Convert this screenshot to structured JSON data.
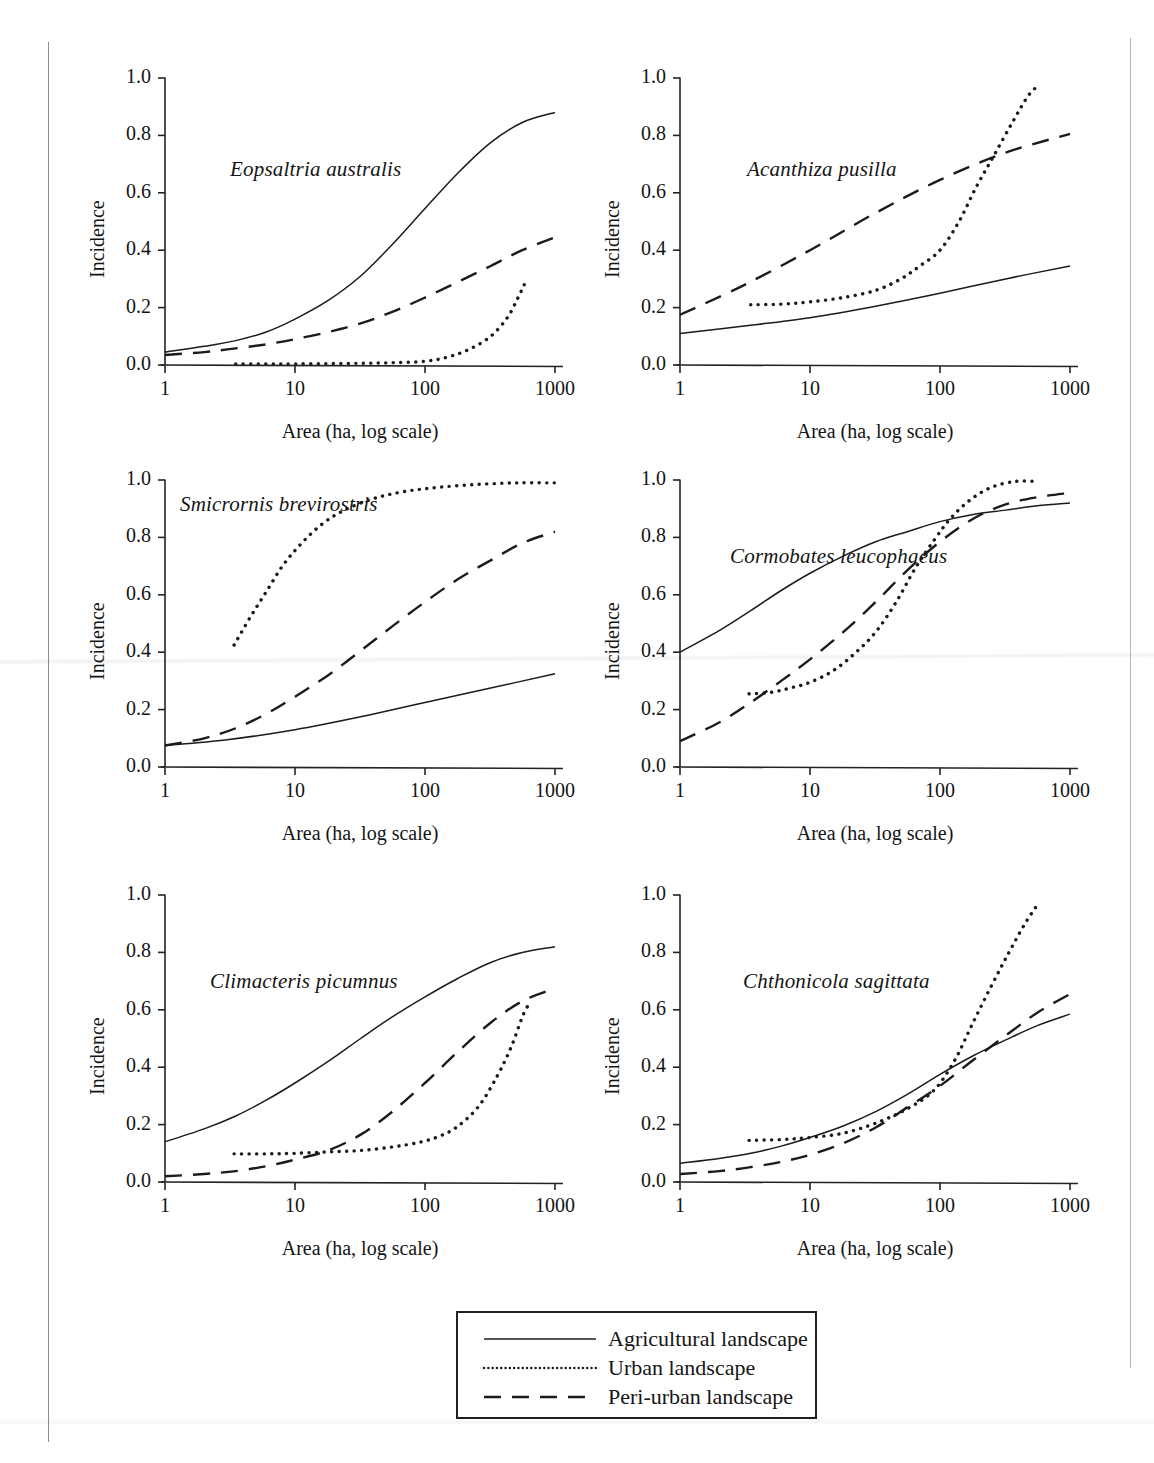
{
  "figure": {
    "axis_labels": {
      "x": "Area (ha, log scale)",
      "y": "Incidence"
    },
    "x_ticks": [
      "1",
      "10",
      "100",
      "1000"
    ],
    "y_ticks": [
      "0.0",
      "0.2",
      "0.4",
      "0.6",
      "0.8",
      "1.0"
    ]
  },
  "legend": {
    "items": [
      {
        "label": "Agricultural landscape",
        "style": "solid",
        "swatch": "solid-line-swatch"
      },
      {
        "label": "Urban landscape",
        "style": "dotted",
        "swatch": "dotted-line-swatch"
      },
      {
        "label": "Peri-urban landscape",
        "style": "dashed",
        "swatch": "dashed-line-swatch"
      }
    ]
  },
  "panels": [
    {
      "id": "eopsaltria-australis",
      "species": "Eopsaltria australis"
    },
    {
      "id": "acanthiza-pusilla",
      "species": "Acanthiza pusilla"
    },
    {
      "id": "smicrornis-brevirostris",
      "species": "Smicrornis brevirostris"
    },
    {
      "id": "cormobates-leucophaeus",
      "species": "Cormobates leucophaeus"
    },
    {
      "id": "climacteris-picumnus",
      "species": "Climacteris picumnus"
    },
    {
      "id": "chthonicola-sagittata",
      "species": "Chthonicola sagittata"
    }
  ],
  "chart_data": [
    {
      "type": "line",
      "title": "Eopsaltria australis",
      "xlabel": "Area (ha, log scale)",
      "ylabel": "Incidence",
      "xscale": "log",
      "xlim": [
        1,
        1000
      ],
      "ylim": [
        0,
        1
      ],
      "xticks": [
        1,
        10,
        100,
        1000
      ],
      "yticks": [
        0.0,
        0.2,
        0.4,
        0.6,
        0.8,
        1.0
      ],
      "grid": false,
      "series": [
        {
          "name": "Agricultural landscape",
          "style": "solid",
          "x": [
            1,
            2,
            3.5,
            6,
            10,
            18,
            32,
            56,
            100,
            180,
            320,
            560,
            1000
          ],
          "y": [
            0.045,
            0.065,
            0.085,
            0.115,
            0.16,
            0.225,
            0.31,
            0.42,
            0.545,
            0.67,
            0.775,
            0.845,
            0.88
          ]
        },
        {
          "name": "Urban landscape",
          "style": "dotted",
          "x": [
            3.5,
            6,
            10,
            18,
            32,
            56,
            100,
            150,
            220,
            320,
            430,
            520,
            580
          ],
          "y": [
            0.004,
            0.004,
            0.004,
            0.005,
            0.006,
            0.008,
            0.013,
            0.028,
            0.055,
            0.1,
            0.165,
            0.235,
            0.28
          ]
        },
        {
          "name": "Peri-urban landscape",
          "style": "dashed",
          "x": [
            1,
            2,
            3.5,
            6,
            10,
            18,
            32,
            56,
            100,
            180,
            320,
            560,
            1000
          ],
          "y": [
            0.035,
            0.045,
            0.058,
            0.072,
            0.09,
            0.115,
            0.145,
            0.185,
            0.235,
            0.29,
            0.345,
            0.4,
            0.445
          ]
        }
      ]
    },
    {
      "type": "line",
      "title": "Acanthiza pusilla",
      "xlabel": "Area (ha, log scale)",
      "ylabel": "Incidence",
      "xscale": "log",
      "xlim": [
        1,
        1000
      ],
      "ylim": [
        0,
        1
      ],
      "xticks": [
        1,
        10,
        100,
        1000
      ],
      "yticks": [
        0.0,
        0.2,
        0.4,
        0.6,
        0.8,
        1.0
      ],
      "grid": false,
      "series": [
        {
          "name": "Agricultural landscape",
          "style": "solid",
          "x": [
            1,
            3,
            10,
            32,
            100,
            320,
            1000
          ],
          "y": [
            0.11,
            0.135,
            0.165,
            0.205,
            0.25,
            0.3,
            0.345
          ]
        },
        {
          "name": "Urban landscape",
          "style": "dotted",
          "x": [
            3.5,
            6,
            10,
            18,
            32,
            50,
            70,
            100,
            140,
            190,
            260,
            360,
            480,
            580
          ],
          "y": [
            0.21,
            0.212,
            0.22,
            0.235,
            0.26,
            0.3,
            0.345,
            0.4,
            0.5,
            0.62,
            0.73,
            0.845,
            0.94,
            0.975
          ]
        },
        {
          "name": "Peri-urban landscape",
          "style": "dashed",
          "x": [
            1,
            3,
            10,
            32,
            100,
            320,
            1000
          ],
          "y": [
            0.175,
            0.275,
            0.4,
            0.53,
            0.645,
            0.74,
            0.805
          ]
        }
      ]
    },
    {
      "type": "line",
      "title": "Smicrornis brevirostris",
      "xlabel": "Area (ha, log scale)",
      "ylabel": "Incidence",
      "xscale": "log",
      "xlim": [
        1,
        1000
      ],
      "ylim": [
        0,
        1
      ],
      "xticks": [
        1,
        10,
        100,
        1000
      ],
      "yticks": [
        0.0,
        0.2,
        0.4,
        0.6,
        0.8,
        1.0
      ],
      "grid": false,
      "series": [
        {
          "name": "Agricultural landscape",
          "style": "solid",
          "x": [
            1,
            3,
            10,
            32,
            100,
            320,
            1000
          ],
          "y": [
            0.075,
            0.095,
            0.13,
            0.175,
            0.225,
            0.275,
            0.325
          ]
        },
        {
          "name": "Urban landscape",
          "style": "dotted",
          "x": [
            3.4,
            4.5,
            6,
            8,
            11,
            16,
            24,
            40,
            70,
            130,
            260,
            520,
            1000
          ],
          "y": [
            0.425,
            0.52,
            0.61,
            0.7,
            0.775,
            0.845,
            0.895,
            0.935,
            0.96,
            0.975,
            0.985,
            0.99,
            0.99
          ]
        },
        {
          "name": "Peri-urban landscape",
          "style": "dashed",
          "x": [
            1,
            2,
            3.5,
            6,
            10,
            18,
            32,
            56,
            100,
            180,
            320,
            560,
            1000
          ],
          "y": [
            0.075,
            0.1,
            0.135,
            0.185,
            0.245,
            0.32,
            0.405,
            0.49,
            0.575,
            0.655,
            0.72,
            0.78,
            0.82
          ]
        }
      ]
    },
    {
      "type": "line",
      "title": "Cormobates leucophaeus",
      "xlabel": "Area (ha, log scale)",
      "ylabel": "Incidence",
      "xscale": "log",
      "xlim": [
        1,
        1000
      ],
      "ylim": [
        0,
        1
      ],
      "xticks": [
        1,
        10,
        100,
        1000
      ],
      "yticks": [
        0.0,
        0.2,
        0.4,
        0.6,
        0.8,
        1.0
      ],
      "grid": false,
      "series": [
        {
          "name": "Agricultural landscape",
          "style": "solid",
          "x": [
            1,
            2,
            3.5,
            6,
            10,
            18,
            32,
            56,
            100,
            180,
            320,
            560,
            1000
          ],
          "y": [
            0.4,
            0.475,
            0.545,
            0.615,
            0.675,
            0.735,
            0.785,
            0.82,
            0.855,
            0.88,
            0.895,
            0.91,
            0.92
          ]
        },
        {
          "name": "Urban landscape",
          "style": "dotted",
          "x": [
            3.4,
            5,
            7,
            10,
            15,
            22,
            32,
            46,
            65,
            90,
            120,
            170,
            250,
            380,
            560
          ],
          "y": [
            0.255,
            0.26,
            0.275,
            0.295,
            0.335,
            0.395,
            0.47,
            0.575,
            0.695,
            0.79,
            0.865,
            0.93,
            0.975,
            0.995,
            0.995
          ]
        },
        {
          "name": "Peri-urban landscape",
          "style": "dashed",
          "x": [
            1,
            2,
            3.5,
            6,
            10,
            18,
            32,
            56,
            100,
            180,
            320,
            560,
            1000
          ],
          "y": [
            0.09,
            0.155,
            0.225,
            0.3,
            0.375,
            0.47,
            0.575,
            0.685,
            0.785,
            0.865,
            0.915,
            0.94,
            0.955
          ]
        }
      ]
    },
    {
      "type": "line",
      "title": "Climacteris picumnus",
      "xlabel": "Area (ha, log scale)",
      "ylabel": "Incidence",
      "xscale": "log",
      "xlim": [
        1,
        1000
      ],
      "ylim": [
        0,
        1
      ],
      "xticks": [
        1,
        10,
        100,
        1000
      ],
      "yticks": [
        0.0,
        0.2,
        0.4,
        0.6,
        0.8,
        1.0
      ],
      "grid": false,
      "series": [
        {
          "name": "Agricultural landscape",
          "style": "solid",
          "x": [
            1,
            2,
            3.5,
            6,
            10,
            18,
            32,
            56,
            100,
            180,
            320,
            560,
            1000
          ],
          "y": [
            0.14,
            0.185,
            0.23,
            0.285,
            0.345,
            0.42,
            0.5,
            0.575,
            0.645,
            0.71,
            0.765,
            0.8,
            0.82
          ]
        },
        {
          "name": "Urban landscape",
          "style": "dotted",
          "x": [
            3.4,
            6,
            10,
            18,
            32,
            56,
            90,
            130,
            180,
            260,
            360,
            460,
            560,
            620
          ],
          "y": [
            0.098,
            0.098,
            0.1,
            0.105,
            0.11,
            0.122,
            0.138,
            0.16,
            0.195,
            0.265,
            0.37,
            0.47,
            0.575,
            0.615
          ]
        },
        {
          "name": "Peri-urban landscape",
          "style": "dashed",
          "x": [
            1,
            2,
            3.5,
            6,
            10,
            18,
            32,
            56,
            100,
            180,
            320,
            560,
            1000
          ],
          "y": [
            0.02,
            0.028,
            0.038,
            0.055,
            0.078,
            0.11,
            0.165,
            0.245,
            0.345,
            0.455,
            0.555,
            0.63,
            0.675
          ]
        }
      ]
    },
    {
      "type": "line",
      "title": "Chthonicola sagittata",
      "xlabel": "Area (ha, log scale)",
      "ylabel": "Incidence",
      "xscale": "log",
      "xlim": [
        1,
        1000
      ],
      "ylim": [
        0,
        1
      ],
      "xticks": [
        1,
        10,
        100,
        1000
      ],
      "yticks": [
        0.0,
        0.2,
        0.4,
        0.6,
        0.8,
        1.0
      ],
      "grid": false,
      "series": [
        {
          "name": "Agricultural landscape",
          "style": "solid",
          "x": [
            1,
            2,
            3.5,
            6,
            10,
            18,
            32,
            56,
            100,
            180,
            320,
            560,
            1000
          ],
          "y": [
            0.065,
            0.082,
            0.1,
            0.125,
            0.155,
            0.195,
            0.245,
            0.305,
            0.375,
            0.44,
            0.495,
            0.545,
            0.585
          ]
        },
        {
          "name": "Urban landscape",
          "style": "dotted",
          "x": [
            3.4,
            6,
            10,
            18,
            32,
            56,
            90,
            130,
            175,
            240,
            330,
            450,
            580
          ],
          "y": [
            0.145,
            0.148,
            0.155,
            0.17,
            0.205,
            0.255,
            0.32,
            0.425,
            0.545,
            0.67,
            0.79,
            0.9,
            0.975
          ]
        },
        {
          "name": "Peri-urban landscape",
          "style": "dashed",
          "x": [
            1,
            2,
            3.5,
            6,
            10,
            18,
            32,
            56,
            100,
            180,
            320,
            560,
            1000
          ],
          "y": [
            0.028,
            0.038,
            0.052,
            0.07,
            0.095,
            0.135,
            0.19,
            0.26,
            0.335,
            0.425,
            0.51,
            0.59,
            0.655
          ]
        }
      ]
    }
  ]
}
